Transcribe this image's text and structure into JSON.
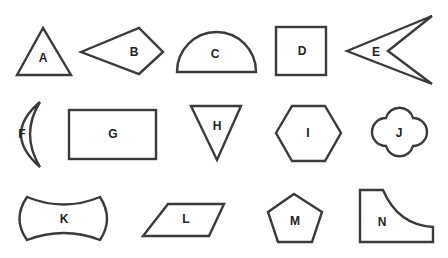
{
  "colors": {
    "stroke": "#3a3a3a",
    "fill": "#ffffff",
    "text": "#222222",
    "background": "#ffffff"
  },
  "shapes": [
    {
      "label": "A",
      "type": "triangle"
    },
    {
      "label": "B",
      "type": "kite"
    },
    {
      "label": "C",
      "type": "semicircle"
    },
    {
      "label": "D",
      "type": "square"
    },
    {
      "label": "E",
      "type": "arrowhead / concave quadrilateral"
    },
    {
      "label": "F",
      "type": "crescent"
    },
    {
      "label": "G",
      "type": "rectangle"
    },
    {
      "label": "H",
      "type": "inverted triangle"
    },
    {
      "label": "I",
      "type": "hexagon"
    },
    {
      "label": "J",
      "type": "quatrefoil"
    },
    {
      "label": "K",
      "type": "concave curved shape"
    },
    {
      "label": "L",
      "type": "parallelogram"
    },
    {
      "label": "M",
      "type": "pentagon"
    },
    {
      "label": "N",
      "type": "quadrilateral with concave curved side"
    }
  ]
}
